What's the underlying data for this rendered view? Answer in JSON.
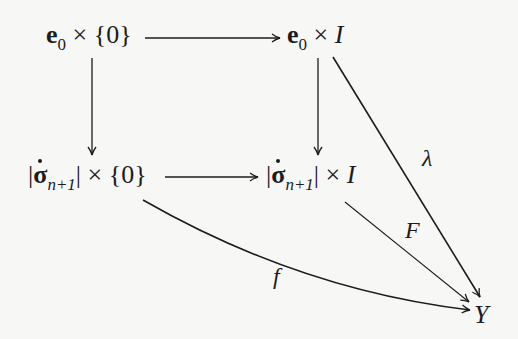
{
  "diagram": {
    "type": "commutative-diagram",
    "nodes": {
      "top_left": {
        "base": "e",
        "base_sub": "0",
        "times": "×",
        "set": "{0}"
      },
      "top_right": {
        "base": "e",
        "base_sub": "0",
        "times": "×",
        "interval": "I"
      },
      "bottom_left": {
        "bar_l": "|",
        "sigma": "σ",
        "sub": "n+1",
        "bar_r": "|",
        "times": "×",
        "set": "{0}"
      },
      "bottom_right": {
        "bar_l": "|",
        "sigma": "σ",
        "sub": "n+1",
        "bar_r": "|",
        "times": "×",
        "interval": "I"
      },
      "target": {
        "label": "Y"
      }
    },
    "edges": {
      "lambda": {
        "label": "λ",
        "from": "top_right",
        "to": "target"
      },
      "F": {
        "label": "F",
        "from": "bottom_right",
        "to": "target"
      },
      "f": {
        "label": "f",
        "from": "bottom_left",
        "to": "target"
      }
    },
    "stroke_color": "#1c1c1c",
    "background_color": "#f7f7f5"
  }
}
